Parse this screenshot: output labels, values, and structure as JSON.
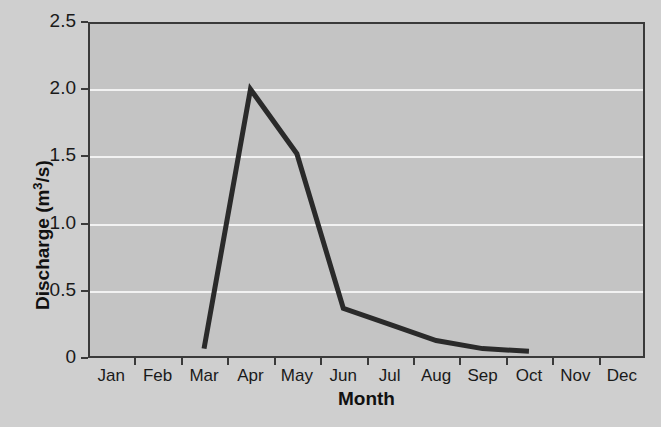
{
  "chart_data": {
    "type": "line",
    "title": "",
    "xlabel": "Month",
    "ylabel": "Discharge (m3/s)",
    "ylabel_base": "Discharge (m",
    "ylabel_sup": "3",
    "ylabel_tail": "/s)",
    "categories": [
      "Jan",
      "Feb",
      "Mar",
      "Apr",
      "May",
      "Jun",
      "Jul",
      "Aug",
      "Sep",
      "Oct",
      "Nov",
      "Dec"
    ],
    "values": [
      null,
      null,
      0.07,
      2.0,
      1.52,
      0.37,
      0.25,
      0.13,
      0.07,
      0.05,
      null,
      null
    ],
    "series": [
      {
        "name": "Discharge",
        "points": [
          {
            "month": "Mar",
            "value": 0.07
          },
          {
            "month": "Apr",
            "value": 2.0
          },
          {
            "month": "May",
            "value": 1.52
          },
          {
            "month": "Jun",
            "value": 0.37
          },
          {
            "month": "Jul",
            "value": 0.25
          },
          {
            "month": "Aug",
            "value": 0.13
          },
          {
            "month": "Sep",
            "value": 0.07
          },
          {
            "month": "Oct",
            "value": 0.05
          }
        ]
      }
    ],
    "ylim": [
      0,
      2.5
    ],
    "ytick_labels": [
      "0",
      "0.5",
      "1.0",
      "1.5",
      "2.0",
      "2.5"
    ],
    "ytick_values": [
      0,
      0.5,
      1.0,
      1.5,
      2.0,
      2.5
    ],
    "grid": true,
    "grid_color": "#f2f2f2",
    "legend": "none",
    "line_color": "#2a2a2a",
    "plot_background": "#c4c4c4",
    "page_background": "#cfcfcf",
    "axis_color": "#3a3a3a"
  }
}
